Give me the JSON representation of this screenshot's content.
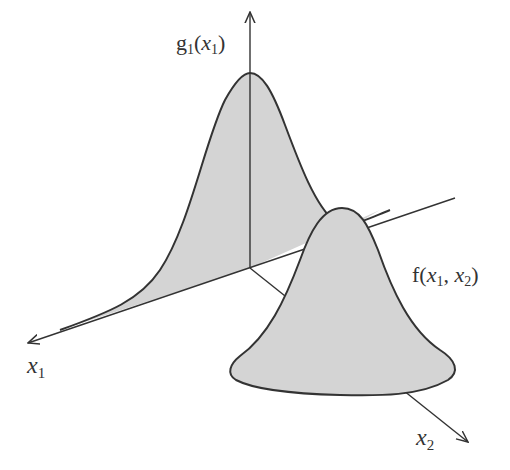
{
  "diagram": {
    "labels": {
      "g1_fn": "g",
      "g1_sub": "1",
      "g1_open": "(",
      "g1_var": "x",
      "g1_var_sub": "1",
      "g1_close": ")",
      "f_fn": "f(",
      "f_var1": "x",
      "f_var1_sub": "1",
      "f_comma": ", ",
      "f_var2": "x",
      "f_var2_sub": "2",
      "f_close": ")",
      "x1_axis": "x",
      "x1_axis_sub": "1",
      "x2_axis": "x",
      "x2_axis_sub": "2"
    },
    "colors": {
      "fill": "#d4d4d4",
      "stroke": "#333333"
    }
  }
}
